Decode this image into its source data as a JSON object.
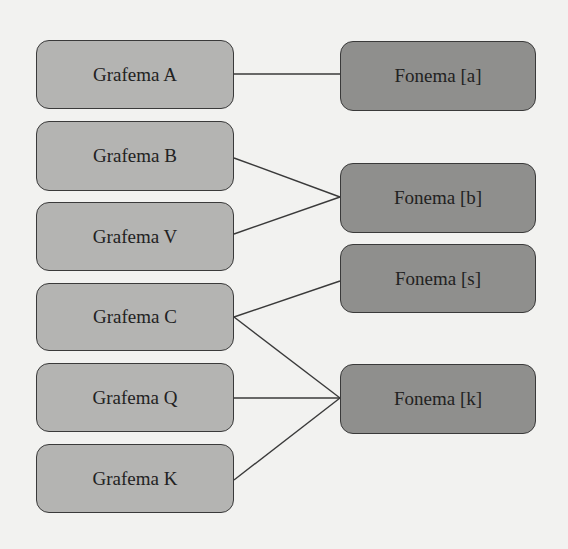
{
  "diagram": {
    "colors": {
      "background": "#f2f2f0",
      "grapheme_fill": "#b4b4b2",
      "phoneme_fill": "#8f8f8d",
      "stroke": "#3a3a3a"
    },
    "graphemes": [
      {
        "id": "A",
        "label": "Grafema A",
        "x": 36,
        "y": 40,
        "w": 198,
        "h": 69
      },
      {
        "id": "B",
        "label": "Grafema B",
        "x": 36,
        "y": 121,
        "w": 198,
        "h": 70
      },
      {
        "id": "V",
        "label": "Grafema V",
        "x": 36,
        "y": 202,
        "w": 198,
        "h": 69
      },
      {
        "id": "C",
        "label": "Grafema C",
        "x": 36,
        "y": 283,
        "w": 198,
        "h": 68
      },
      {
        "id": "Q",
        "label": "Grafema Q",
        "x": 36,
        "y": 363,
        "w": 198,
        "h": 69
      },
      {
        "id": "K",
        "label": "Grafema K",
        "x": 36,
        "y": 444,
        "w": 198,
        "h": 69
      }
    ],
    "phonemes": [
      {
        "id": "a",
        "label": "Fonema [a]",
        "x": 340,
        "y": 41,
        "w": 196,
        "h": 70
      },
      {
        "id": "b",
        "label": "Fonema [b]",
        "x": 340,
        "y": 163,
        "w": 196,
        "h": 70
      },
      {
        "id": "s",
        "label": "Fonema [s]",
        "x": 340,
        "y": 244,
        "w": 196,
        "h": 69
      },
      {
        "id": "k",
        "label": "Fonema [k]",
        "x": 340,
        "y": 364,
        "w": 196,
        "h": 70
      }
    ],
    "connections": [
      {
        "from": "A",
        "to": "a",
        "x1": 234,
        "y1": 74,
        "x2": 340,
        "y2": 74
      },
      {
        "from": "B",
        "to": "b",
        "x1": 234,
        "y1": 158,
        "x2": 340,
        "y2": 197
      },
      {
        "from": "V",
        "to": "b",
        "x1": 234,
        "y1": 234,
        "x2": 340,
        "y2": 197
      },
      {
        "from": "C",
        "to": "s",
        "x1": 234,
        "y1": 317,
        "x2": 340,
        "y2": 281
      },
      {
        "from": "C",
        "to": "k",
        "x1": 234,
        "y1": 317,
        "x2": 340,
        "y2": 398
      },
      {
        "from": "Q",
        "to": "k",
        "x1": 234,
        "y1": 398,
        "x2": 340,
        "y2": 398
      },
      {
        "from": "K",
        "to": "k",
        "x1": 234,
        "y1": 480,
        "x2": 340,
        "y2": 398
      }
    ]
  }
}
